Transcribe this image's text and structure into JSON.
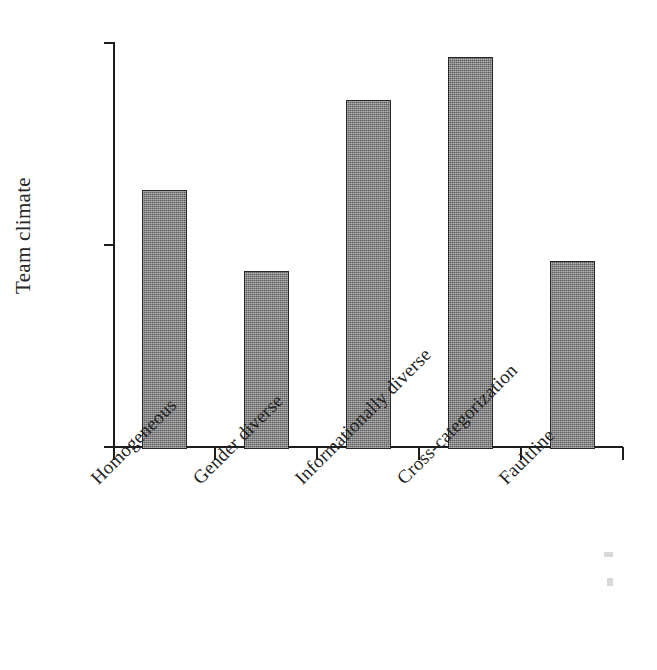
{
  "chart_data": {
    "type": "bar",
    "title": "",
    "xlabel": "",
    "ylabel": "Team climate",
    "categories": [
      "Homogeneous",
      "Gender diverse",
      "Informationally diverse",
      "Cross-categorization",
      "Faultline"
    ],
    "values": [
      4.27,
      3.87,
      4.72,
      4.93,
      3.92
    ],
    "ylim": [
      3.0,
      5.0
    ],
    "yticks": [
      3.0,
      4.0,
      5.0
    ],
    "ytick_labels": [
      "3.0",
      "4.0",
      "5.0"
    ],
    "grid": false,
    "legend": false,
    "bar_color": "#838383",
    "bar_edge_color": "#272727",
    "axis_color": "#1d1d1d",
    "background_color": "#ffffff"
  }
}
